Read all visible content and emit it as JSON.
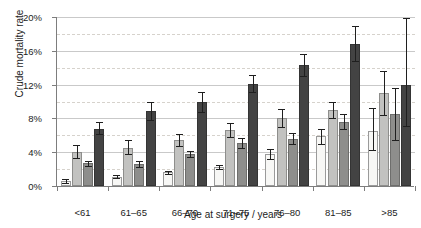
{
  "chart_data": {
    "type": "bar",
    "title": "",
    "xlabel": "Age at surgery / years",
    "ylabel": "Crude mortality rate",
    "categories": [
      "<61",
      "61–65",
      "66–70",
      "71–75",
      "76–80",
      "81–85",
      ">85"
    ],
    "ylim": [
      0,
      20
    ],
    "ytick_labels": [
      "0%",
      "4%",
      "8%",
      "12%",
      "16%",
      "20%"
    ],
    "ytick_values": [
      0,
      4,
      8,
      12,
      16,
      20
    ],
    "minor_gridlines": [
      2,
      6,
      10,
      14,
      18
    ],
    "grid": true,
    "legend": "none",
    "units": "percent",
    "series": [
      {
        "name": "series-1",
        "color": "#f7f7f5",
        "values": [
          0.6,
          1.1,
          1.6,
          2.2,
          3.8,
          5.9,
          6.5
        ],
        "err_low": [
          0.4,
          0.9,
          1.4,
          2.0,
          3.2,
          5.0,
          4.3
        ],
        "err_high": [
          0.8,
          1.3,
          1.8,
          2.5,
          4.4,
          6.8,
          9.2
        ]
      },
      {
        "name": "series-2",
        "color": "#c2c2c0",
        "values": [
          4.0,
          4.5,
          5.4,
          6.6,
          8.0,
          9.0,
          11.0
        ],
        "err_low": [
          3.3,
          3.8,
          4.7,
          5.8,
          7.0,
          8.0,
          8.4
        ],
        "err_high": [
          4.8,
          5.4,
          6.2,
          7.4,
          9.1,
          10.0,
          13.6
        ]
      },
      {
        "name": "series-3",
        "color": "#8e8e8c",
        "values": [
          2.7,
          2.6,
          3.8,
          5.1,
          5.6,
          7.6,
          8.5
        ],
        "err_low": [
          2.4,
          2.2,
          3.4,
          4.5,
          5.0,
          6.7,
          5.4
        ],
        "err_high": [
          3.0,
          3.0,
          4.2,
          5.7,
          6.3,
          8.5,
          11.6
        ]
      },
      {
        "name": "series-4",
        "color": "#434343",
        "values": [
          6.8,
          8.9,
          9.9,
          12.1,
          14.3,
          16.8,
          12.0
        ],
        "err_low": [
          6.1,
          7.8,
          8.8,
          11.1,
          13.0,
          14.8,
          7.1
        ],
        "err_high": [
          7.6,
          10.0,
          11.1,
          13.1,
          15.6,
          18.9,
          19.9
        ]
      }
    ]
  }
}
